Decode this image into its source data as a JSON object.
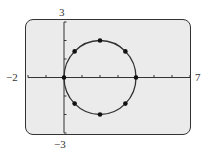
{
  "chart_data": {
    "type": "scatter",
    "title": "",
    "xlabel": "",
    "ylabel": "",
    "xlim": [
      -2,
      7
    ],
    "ylim": [
      -3,
      3
    ],
    "x_tick_step": 1,
    "y_tick_step": 1,
    "grid": false,
    "window_labels": {
      "xmin": "−2",
      "xmax": "7",
      "ymax": "3",
      "ymin": "−3"
    },
    "curve": {
      "shape": "circle",
      "center": [
        2,
        0
      ],
      "radius": 2
    },
    "series": [
      {
        "name": "points",
        "x": [
          0,
          0.59,
          2,
          3.41,
          4,
          3.41,
          2,
          0.59
        ],
        "y": [
          0,
          1.41,
          2,
          1.41,
          0,
          -1.41,
          -2,
          -1.41
        ]
      }
    ]
  },
  "colors": {
    "screen_bg": "#ebebeb",
    "ink": "#333333"
  }
}
